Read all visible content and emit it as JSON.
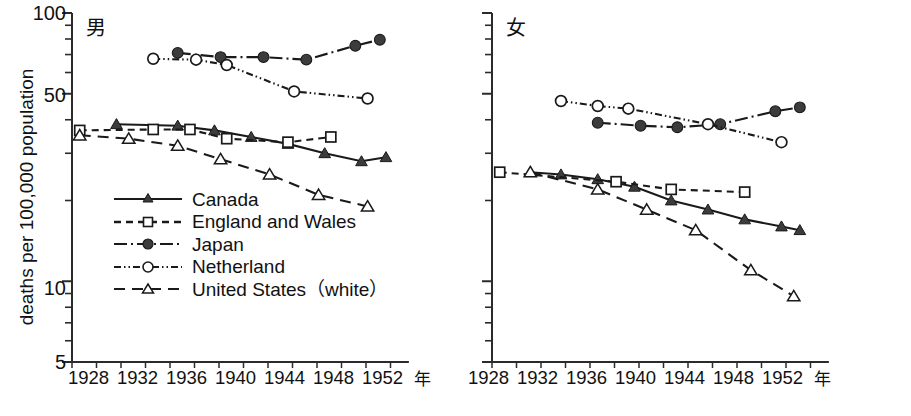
{
  "figure": {
    "y_axis_title": "deaths per 100,000 population",
    "x_axis_unit": "年",
    "y_ticks": [
      "100",
      "50",
      "10",
      "5"
    ],
    "x_ticks": [
      "1928",
      "1932",
      "1936",
      "1940",
      "1944",
      "1948",
      "1952"
    ]
  },
  "panels": {
    "male": {
      "tag": "男"
    },
    "female": {
      "tag": "女"
    }
  },
  "legend": {
    "items": [
      {
        "label": "Canada",
        "key": "canada"
      },
      {
        "label": "England and Wales",
        "key": "england"
      },
      {
        "label": "Japan",
        "key": "japan"
      },
      {
        "label": "Netherland",
        "key": "netherland"
      },
      {
        "label": "United States（white）",
        "key": "usa"
      }
    ]
  },
  "colors": {
    "ink": "#1a1a1a",
    "axis": "#2b2b2b",
    "marker_fill_solid": "#3c3c3c",
    "marker_fill_open": "#ffffff",
    "background": "#ffffff"
  },
  "chart_data": {
    "type": "line",
    "title": "",
    "xlabel": "年",
    "ylabel": "deaths per 100,000 population",
    "yscale": "log",
    "ylim": [
      5,
      100
    ],
    "xlim": [
      1927,
      1954
    ],
    "ytick_values": [
      100,
      50,
      10,
      5
    ],
    "xtick_values": [
      1928,
      1932,
      1936,
      1940,
      1944,
      1948,
      1952
    ],
    "grid": false,
    "legend_position": "lower-left-of-male-panel",
    "panels": [
      {
        "name": "男",
        "series": [
          {
            "name": "Canada",
            "marker": "filled-triangle",
            "line": "solid",
            "x": [
              1931,
              1936,
              1939,
              1942,
              1945,
              1948,
              1951,
              1953
            ],
            "y": [
              38.5,
              38.0,
              36.5,
              34.5,
              32.5,
              30.0,
              28.0,
              29.0
            ]
          },
          {
            "name": "England and Wales",
            "marker": "open-square",
            "line": "dashed",
            "x": [
              1928,
              1934,
              1937,
              1940,
              1945,
              1948.5
            ],
            "y": [
              36.5,
              36.8,
              36.8,
              34.0,
              33.0,
              34.5
            ]
          },
          {
            "name": "Japan",
            "marker": "filled-circle",
            "line": "dash-dot",
            "x": [
              1936,
              1939.5,
              1943,
              1946.5,
              1950.5,
              1952.5
            ],
            "y": [
              71.0,
              68.5,
              68.5,
              67.0,
              75.5,
              79.5
            ]
          },
          {
            "name": "Netherland",
            "marker": "open-circle",
            "line": "dash-dot-dot",
            "x": [
              1934,
              1937.5,
              1940,
              1945.5,
              1951.5
            ],
            "y": [
              67.5,
              67.0,
              64.0,
              51.0,
              48.0
            ]
          },
          {
            "name": "United States (white)",
            "marker": "open-triangle",
            "line": "long-dashed",
            "x": [
              1928,
              1932,
              1936,
              1939.5,
              1943.5,
              1947.5,
              1951.5
            ],
            "y": [
              35.0,
              34.0,
              32.0,
              28.5,
              25.0,
              21.0,
              19.0
            ]
          }
        ]
      },
      {
        "name": "女",
        "series": [
          {
            "name": "Canada",
            "marker": "filled-triangle",
            "line": "solid",
            "x": [
              1930.5,
              1933,
              1936,
              1939,
              1942,
              1945,
              1948,
              1951,
              1952.5
            ],
            "y": [
              25.5,
              25.0,
              24.0,
              22.5,
              20.0,
              18.5,
              17.0,
              16.0,
              15.5
            ]
          },
          {
            "name": "England and Wales",
            "marker": "open-square",
            "line": "dashed",
            "x": [
              1928,
              1937.5,
              1942,
              1948
            ],
            "y": [
              25.5,
              23.5,
              22.0,
              21.5
            ]
          },
          {
            "name": "Japan",
            "marker": "filled-circle",
            "line": "dash-dot",
            "x": [
              1936,
              1939.5,
              1942.5,
              1946,
              1950.5,
              1952.5
            ],
            "y": [
              39.0,
              38.0,
              37.5,
              38.5,
              43.0,
              44.5
            ]
          },
          {
            "name": "Netherland",
            "marker": "open-circle",
            "line": "dash-dot-dot",
            "x": [
              1933,
              1936,
              1938.5,
              1945,
              1951
            ],
            "y": [
              47.0,
              45.0,
              44.0,
              38.5,
              33.0
            ]
          },
          {
            "name": "United States (white)",
            "marker": "open-triangle",
            "line": "long-dashed",
            "x": [
              1930.5,
              1936,
              1940,
              1944,
              1948.5,
              1952
            ],
            "y": [
              25.5,
              22.0,
              18.5,
              15.5,
              11.0,
              8.8
            ]
          }
        ]
      }
    ]
  }
}
